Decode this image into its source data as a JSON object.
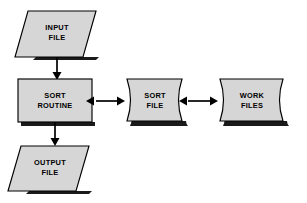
{
  "diagram": {
    "type": "flowchart",
    "background_color": "#ffffff",
    "shape_fill_color": "#d6d6d6",
    "shape_stroke_color": "#000000",
    "label_color": "#000000",
    "nodes": [
      {
        "id": "input-file",
        "shape": "parallelogram",
        "shape_meaning": "input-output",
        "line1": "INPUT",
        "line2": "FILE"
      },
      {
        "id": "sort-routine",
        "shape": "rectangle",
        "shape_meaning": "process",
        "line1": "SORT",
        "line2": "ROUTINE"
      },
      {
        "id": "output-file",
        "shape": "parallelogram",
        "shape_meaning": "input-output",
        "line1": "OUTPUT",
        "line2": "FILE"
      },
      {
        "id": "sort-file",
        "shape": "curved-tape",
        "shape_meaning": "stored-data",
        "line1": "SORT",
        "line2": "FILE"
      },
      {
        "id": "work-files",
        "shape": "curved-tape",
        "shape_meaning": "stored-data",
        "line1": "WORK",
        "line2": "FILES"
      }
    ],
    "connectors": [
      {
        "id": "input-to-sort-routine",
        "from": "input-file",
        "to": "sort-routine",
        "direction": "down",
        "arrowheads": "single"
      },
      {
        "id": "sort-routine-to-output",
        "from": "sort-routine",
        "to": "output-file",
        "direction": "down",
        "arrowheads": "single"
      },
      {
        "id": "sort-routine-to-sort-file",
        "from": "sort-routine",
        "to": "sort-file",
        "direction": "horizontal",
        "arrowheads": "double"
      },
      {
        "id": "sort-file-to-work-files",
        "from": "sort-file",
        "to": "work-files",
        "direction": "horizontal",
        "arrowheads": "double"
      }
    ]
  }
}
